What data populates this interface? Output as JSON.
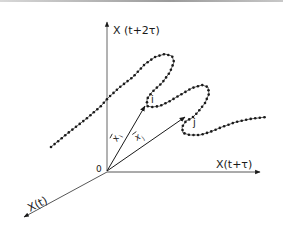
{
  "diagram": {
    "type": "phase-space-reconstruction",
    "axes": {
      "vertical": {
        "label": "X (t+2τ)"
      },
      "horizontal": {
        "label": "X(t+τ)"
      },
      "depth": {
        "label": "X(t)"
      },
      "origin": {
        "label": "0"
      }
    },
    "points": {
      "i": {
        "label": "i"
      },
      "j": {
        "label": "j"
      }
    },
    "vectors": {
      "xi": {
        "label": "x",
        "subscript": "i",
        "target": "i"
      },
      "xj": {
        "label": "x",
        "subscript": "j",
        "target": "j"
      }
    },
    "trajectory": {
      "style": "dotted-line",
      "marker_color": "#1a1a1a",
      "line_color": "#555555"
    },
    "colors": {
      "ink": "#1a1a1a",
      "axis": "#3a3a3a",
      "background": "#ffffff"
    }
  }
}
